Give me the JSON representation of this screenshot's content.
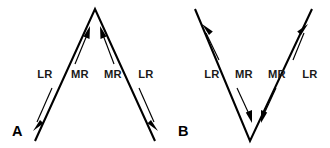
{
  "figure": {
    "background_color": "#ffffff",
    "stroke_color": "#000000",
    "label_color": "#1a1a1a",
    "width": 330,
    "height": 148
  },
  "panels": [
    {
      "id": "A",
      "label": "A",
      "label_x": 12,
      "label_y": 136,
      "apex": {
        "x": 95,
        "y": 9
      },
      "left_end": {
        "x": 35,
        "y": 141
      },
      "right_end": {
        "x": 155,
        "y": 141
      },
      "shape": "inverted-v",
      "muscle_labels": [
        {
          "name": "LR",
          "text": "LR",
          "x": 45,
          "y": 78,
          "side": "left",
          "muscle": "lateral-rectus"
        },
        {
          "name": "MR",
          "text": "MR",
          "x": 80,
          "y": 78,
          "side": "left",
          "muscle": "medial-rectus"
        },
        {
          "name": "MR",
          "text": "MR",
          "x": 113,
          "y": 78,
          "side": "right",
          "muscle": "medial-rectus"
        },
        {
          "name": "LR",
          "text": "LR",
          "x": 146,
          "y": 78,
          "side": "right",
          "muscle": "lateral-rectus"
        }
      ],
      "arrows": [
        {
          "name": "left-lr-arrow",
          "direction": "down-left",
          "x1": 51,
          "y1": 89,
          "x2": 34,
          "y2": 127
        },
        {
          "name": "left-mr-arrow",
          "direction": "up-right",
          "x1": 75,
          "y1": 63,
          "x2": 89,
          "y2": 30
        },
        {
          "name": "right-mr-arrow",
          "direction": "up-left",
          "x1": 113,
          "y1": 63,
          "x2": 101,
          "y2": 30
        },
        {
          "name": "right-lr-arrow",
          "direction": "down-right",
          "x1": 140,
          "y1": 89,
          "x2": 156,
          "y2": 127
        }
      ]
    },
    {
      "id": "B",
      "label": "B",
      "label_x": 178,
      "label_y": 136,
      "apex": {
        "x": 250,
        "y": 141
      },
      "left_end": {
        "x": 195,
        "y": 9
      },
      "right_end": {
        "x": 312,
        "y": 9
      },
      "shape": "v",
      "muscle_labels": [
        {
          "name": "LR",
          "text": "LR",
          "x": 212,
          "y": 78,
          "side": "left",
          "muscle": "lateral-rectus"
        },
        {
          "name": "MR",
          "text": "MR",
          "x": 244,
          "y": 78,
          "side": "left",
          "muscle": "medial-rectus"
        },
        {
          "name": "MR",
          "text": "MR",
          "x": 277,
          "y": 78,
          "side": "right",
          "muscle": "medial-rectus"
        },
        {
          "name": "LR",
          "text": "LR",
          "x": 310,
          "y": 78,
          "side": "right",
          "muscle": "lateral-rectus"
        }
      ],
      "arrows": [
        {
          "name": "left-lr-arrow",
          "direction": "up-left",
          "x1": 218,
          "y1": 60,
          "x2": 203,
          "y2": 27
        },
        {
          "name": "left-mr-arrow",
          "direction": "down-right",
          "x1": 238,
          "y1": 88,
          "x2": 252,
          "y2": 122
        },
        {
          "name": "right-mr-arrow",
          "direction": "down-left",
          "x1": 275,
          "y1": 88,
          "x2": 262,
          "y2": 122
        },
        {
          "name": "right-lr-arrow",
          "direction": "up-right",
          "x1": 292,
          "y1": 60,
          "x2": 306,
          "y2": 27
        }
      ]
    }
  ]
}
